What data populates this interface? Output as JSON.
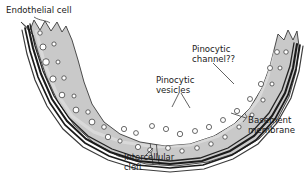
{
  "figure": {
    "background_color": "#ffffff",
    "width": 305,
    "height": 181
  },
  "colors": {
    "cytoplasm_gray": "#c9c9c9",
    "cytoplasm_gray_light": "#d4d4d4",
    "basement_membrane_dark": "#1b1b1b",
    "vesicle_fill": "#ffffff",
    "outline": "#2b2b2b",
    "label_text": "#1a1a1a",
    "leader_line": "#3a3a3a"
  },
  "labels": {
    "endothelial_cell": {
      "text": "Endothelial cell",
      "x": 6,
      "y": 13,
      "anchor": "start"
    },
    "pinocytic_channel": {
      "line1": "Pinocytic",
      "line2": "channel??",
      "x": 192,
      "y": 52,
      "anchor": "start"
    },
    "pinocytic_vesicles": {
      "line1": "Pinocytic",
      "line2": "vesicles",
      "x": 156,
      "y": 83,
      "anchor": "start"
    },
    "basement_membrane": {
      "line1": "Basement",
      "line2": "membrane",
      "x": 248,
      "y": 123,
      "anchor": "start"
    },
    "intercellular_cleft": {
      "line1": "Intercellular",
      "line2": "cleft",
      "x": 124,
      "y": 160,
      "anchor": "start"
    }
  },
  "structures": {
    "endothelium": "gray cytoplasmic band forming a U-shaped curved capillary wall",
    "basement_membrane": "thick dark multi-stroke band along the outer (lower) surface",
    "luminal_border": "jagged sawtooth microvillar edge at both upper tips",
    "vesicles": "white circular pinocytic vesicles scattered through the cytoplasm",
    "cleft": "narrow intercellular cleft crossing the wall near bottom center-right",
    "channel": "pinocytic channel indentation at the right arm"
  }
}
